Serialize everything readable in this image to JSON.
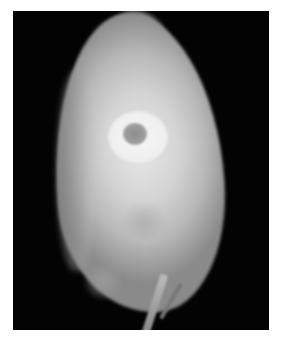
{
  "image": {
    "description": "Grayscale radiograph of a seed on a black background",
    "background_color": "#ffffff",
    "frame_color": "#030303",
    "subject_color": "#d4d4d4",
    "highlight_color": "#f4f4f4",
    "features": [
      "seed-body",
      "seed-tip",
      "bright-ring",
      "ring-hole",
      "inner-lobe",
      "stem"
    ]
  }
}
